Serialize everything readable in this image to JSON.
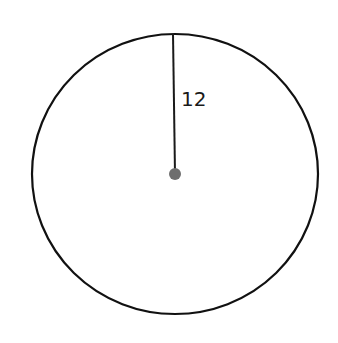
{
  "diagram": {
    "type": "circle-with-radius",
    "circle": {
      "cx": 175,
      "cy": 174,
      "rx": 143,
      "ry": 140,
      "stroke": "#111111",
      "stroke_width": 2.2
    },
    "radius_line": {
      "x1": 173,
      "y1": 34,
      "x2": 175,
      "y2": 174,
      "stroke": "#1a1a1a",
      "stroke_width": 2
    },
    "center_point": {
      "cx": 175,
      "cy": 174,
      "r": 6,
      "fill": "#6e6e6e"
    },
    "radius_label": {
      "text": "12",
      "x": 181,
      "y": 106
    }
  }
}
